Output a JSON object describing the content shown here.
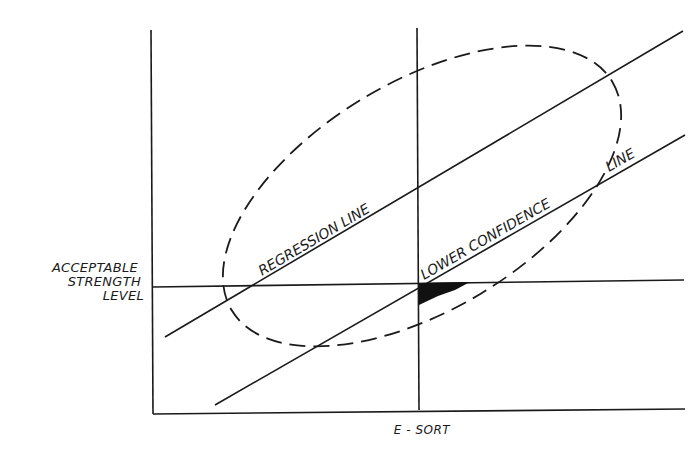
{
  "diagram": {
    "y_axis_label_lines": [
      "ACCEPTABLE",
      "STRENGTH",
      "LEVEL"
    ],
    "x_axis_label": "E - SORT",
    "regression_label": "REGRESSION  LINE",
    "lower_confidence_label": "LOWER CONFIDENCE",
    "lower_confidence_label_tail": "LINE",
    "colors": {
      "ink": "#1a1a1a",
      "background": "#ffffff"
    }
  }
}
